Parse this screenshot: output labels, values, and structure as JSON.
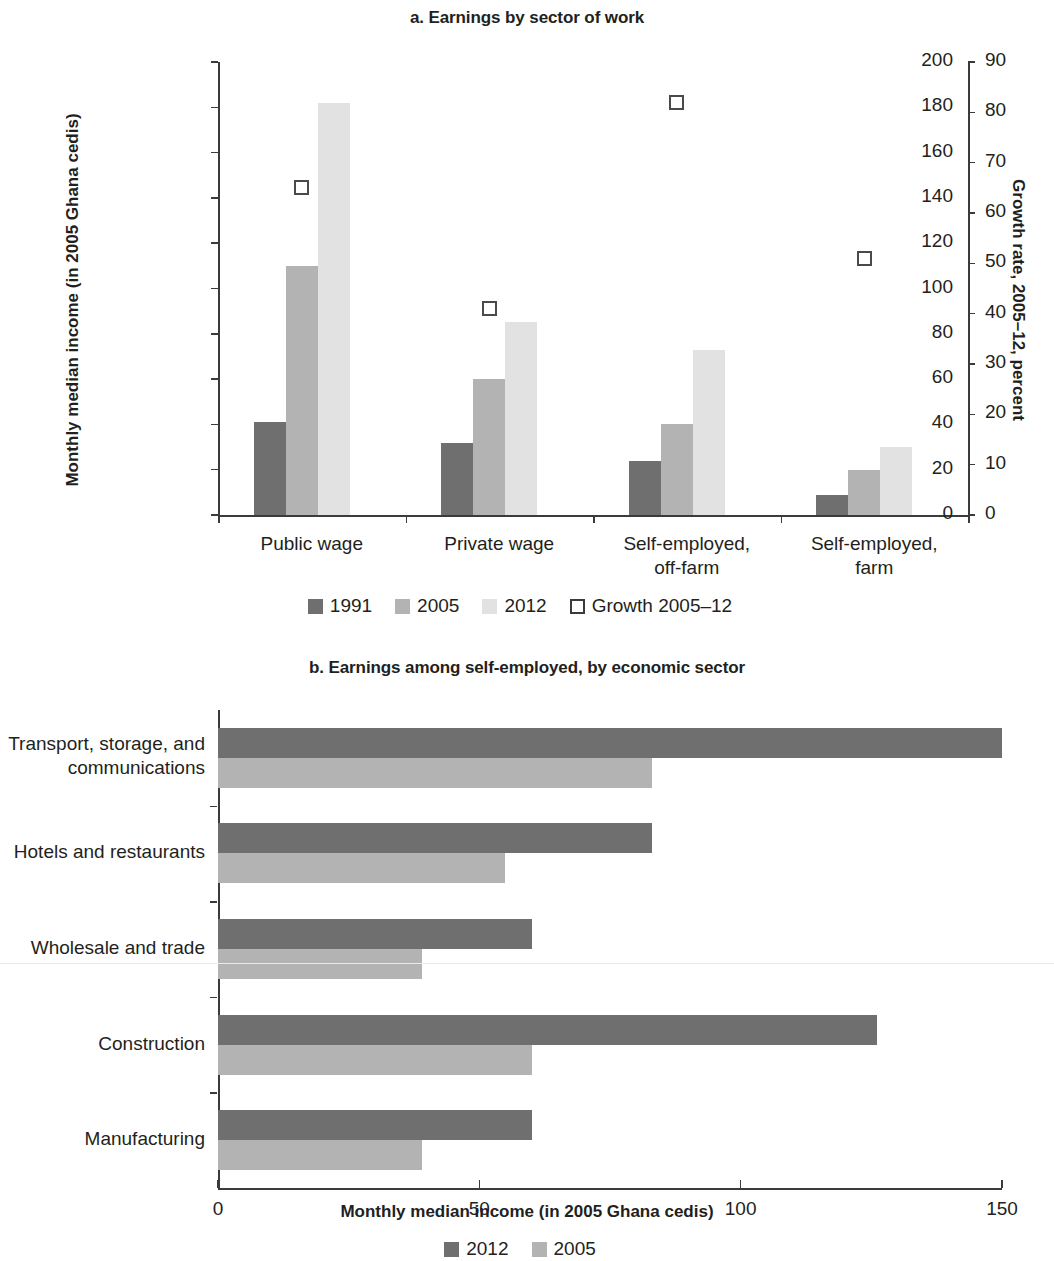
{
  "panel_a": {
    "title": "a. Earnings by sector of work",
    "left_axis_title": "Monthly median income (in 2005 Ghana cedis)",
    "right_axis_title": "Growth rate, 2005–12, percent",
    "left_ticks": [
      "0",
      "20",
      "40",
      "60",
      "80",
      "100",
      "120",
      "140",
      "160",
      "180",
      "200"
    ],
    "right_ticks": [
      "0",
      "10",
      "20",
      "30",
      "40",
      "50",
      "60",
      "70",
      "80",
      "90"
    ],
    "categories": [
      "Public wage",
      "Private wage",
      "Self-employed,\noff-farm",
      "Self-employed,\nfarm"
    ],
    "legend": [
      {
        "label": "1991",
        "color": "#6f6f6f",
        "type": "fill"
      },
      {
        "label": "2005",
        "color": "#b3b3b3",
        "type": "fill"
      },
      {
        "label": "2012",
        "color": "#e2e2e2",
        "type": "fill"
      },
      {
        "label": "Growth 2005–12",
        "color": "#ffffff",
        "type": "open"
      }
    ]
  },
  "panel_b": {
    "title": "b. Earnings among self-employed, by economic sector",
    "x_axis_title": "Monthly median income (in 2005 Ghana cedis)",
    "x_ticks": [
      "0",
      "50",
      "100",
      "150"
    ],
    "categories": [
      "Transport, storage, and\ncommunications",
      "Hotels and restaurants",
      "Wholesale and trade",
      "Construction",
      "Manufacturing"
    ],
    "legend": [
      {
        "label": "2012",
        "color": "#6f6f6f",
        "type": "fill"
      },
      {
        "label": "2005",
        "color": "#b3b3b3",
        "type": "fill"
      }
    ]
  },
  "chart_data": [
    {
      "type": "bar",
      "panel": "a",
      "title": "a. Earnings by sector of work",
      "xlabel": "",
      "ylabel": "Monthly median income (in 2005 Ghana cedis)",
      "y2label": "Growth rate, 2005–12, percent",
      "ylim": [
        0,
        200
      ],
      "y2lim": [
        0,
        90
      ],
      "ytick_step": 20,
      "y2tick_step": 10,
      "grid": false,
      "legend_position": "bottom",
      "categories": [
        "Public wage",
        "Private wage",
        "Self-employed, off-farm",
        "Self-employed, farm"
      ],
      "series": [
        {
          "name": "1991",
          "color": "#6f6f6f",
          "axis": "left",
          "values": [
            41,
            32,
            24,
            9
          ]
        },
        {
          "name": "2005",
          "color": "#b3b3b3",
          "axis": "left",
          "values": [
            110,
            60,
            40,
            20
          ]
        },
        {
          "name": "2012",
          "color": "#e2e2e2",
          "axis": "left",
          "values": [
            182,
            85,
            73,
            30
          ]
        },
        {
          "name": "Growth 2005–12",
          "color": "#ffffff",
          "axis": "right",
          "marker": "open-square",
          "values": [
            65,
            41,
            82,
            51
          ]
        }
      ]
    },
    {
      "type": "bar",
      "panel": "b",
      "orientation": "horizontal",
      "title": "b. Earnings among self-employed, by economic sector",
      "xlabel": "Monthly median income (in 2005 Ghana cedis)",
      "ylabel": "",
      "xlim": [
        0,
        150
      ],
      "xtick_step": 50,
      "grid": false,
      "legend_position": "bottom",
      "categories": [
        "Transport, storage, and communications",
        "Hotels and restaurants",
        "Wholesale and trade",
        "Construction",
        "Manufacturing"
      ],
      "series": [
        {
          "name": "2012",
          "color": "#6f6f6f",
          "values": [
            150,
            83,
            60,
            126,
            60
          ]
        },
        {
          "name": "2005",
          "color": "#b3b3b3",
          "values": [
            83,
            55,
            39,
            60,
            39
          ]
        }
      ]
    }
  ]
}
